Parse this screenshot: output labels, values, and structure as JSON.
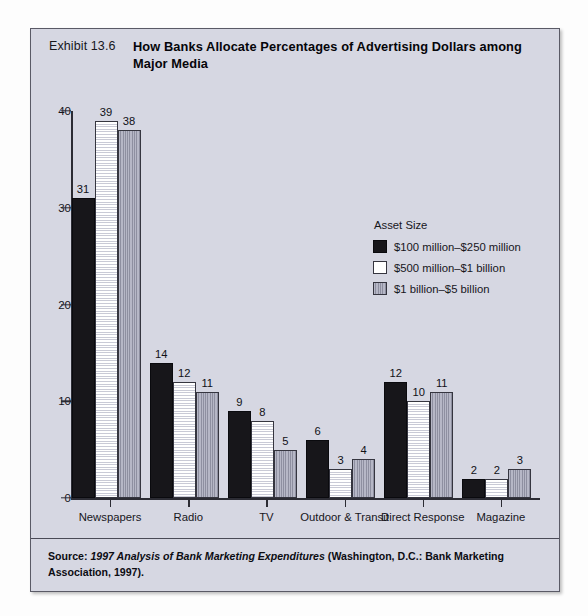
{
  "exhibit": {
    "number": "Exhibit 13.6",
    "title": "How Banks Allocate Percentages of Advertising Dollars among Major Media",
    "source_prefix": "Source: ",
    "source_italic": "1997 Analysis of Bank Marketing Expenditures",
    "source_rest": " (Washington, D.C.: Bank Marketing Association, 1997)."
  },
  "legend": {
    "title": "Asset Size",
    "position": "inside-upper-right",
    "entries": [
      {
        "label": "$100 million–$250 million",
        "swatch": "black-solid",
        "color": "#17161a"
      },
      {
        "label": "$500 million–$1 billion",
        "swatch": "white-horizontal-hatch",
        "color": "#ffffff"
      },
      {
        "label": "$1 billion–$5 billion",
        "swatch": "gray-vertical-hatch",
        "color": "#a8a9b8"
      }
    ]
  },
  "chart_data": {
    "type": "bar",
    "title": "How Banks Allocate Percentages of Advertising Dollars among Major Media",
    "xlabel": "",
    "ylabel": "",
    "categories": [
      "Newspapers",
      "Radio",
      "TV",
      "Outdoor & Transit",
      "Direct Response",
      "Magazine"
    ],
    "series": [
      {
        "name": "$100 million–$250 million",
        "values": [
          31,
          14,
          9,
          6,
          12,
          2
        ]
      },
      {
        "name": "$500 million–$1 billion",
        "values": [
          39,
          12,
          8,
          3,
          10,
          2
        ]
      },
      {
        "name": "$1 billion–$5 billion",
        "values": [
          38,
          11,
          5,
          4,
          11,
          3
        ]
      }
    ],
    "ylim": [
      0,
      40
    ],
    "yticks": [
      0,
      10,
      20,
      30,
      40
    ],
    "grid": false,
    "data_labels": true
  }
}
